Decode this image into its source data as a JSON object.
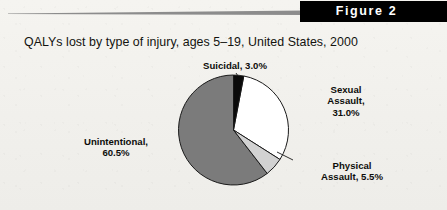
{
  "banner": {
    "label": "Figure 2"
  },
  "title": "QALYs lost by type of injury, ages 5–19, United States, 2000",
  "labels": {
    "suicidal": "Suicidal, 3.0%",
    "sexual_line1": "Sexual",
    "sexual_line2": "Assault,",
    "sexual_line3": "31.0%",
    "physical_line1": "Physical",
    "physical_line2": "Assault, 5.5%",
    "unintentional_line1": "Unintentional,",
    "unintentional_line2": "60.5%"
  },
  "colors": {
    "page_background": "#f3f2ee",
    "banner_background": "#000000",
    "banner_text": "#ffffff",
    "rule": "#8c8c8c",
    "slice_suicidal": "#0a0a0a",
    "slice_sexual_assault": "#ffffff",
    "slice_physical_assault": "#d2d2d2",
    "slice_unintentional": "#7b7b7b",
    "slice_outline": "#1a1a1a",
    "text": "#0d0d0a"
  },
  "chart_data": {
    "type": "pie",
    "title": "QALYs lost by type of injury, ages 5–19, United States, 2000",
    "xlabel": "",
    "ylabel": "",
    "legend_position": "none",
    "labels_position": "outside",
    "grid": false,
    "start_angle_deg": 0,
    "direction": "clockwise",
    "units": "percent",
    "categories": [
      "Suicidal",
      "Sexual Assault",
      "Physical Assault",
      "Unintentional"
    ],
    "values": [
      3.0,
      31.0,
      5.5,
      60.5
    ],
    "slices": [
      {
        "name": "Suicidal",
        "value": 3.0,
        "label": "Suicidal, 3.0%",
        "color": "#0a0a0a"
      },
      {
        "name": "Sexual Assault",
        "value": 31.0,
        "label": "Sexual Assault, 31.0%",
        "color": "#ffffff"
      },
      {
        "name": "Physical Assault",
        "value": 5.5,
        "label": "Physical Assault, 5.5%",
        "color": "#d2d2d2"
      },
      {
        "name": "Unintentional",
        "value": 60.5,
        "label": "Unintentional, 60.5%",
        "color": "#7b7b7b"
      }
    ]
  },
  "geometry": {
    "center_x": 233.5,
    "center_y": 130,
    "radius": 55
  }
}
